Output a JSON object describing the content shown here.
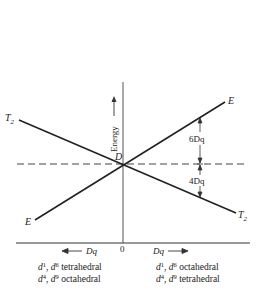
{
  "diagram": {
    "title": "",
    "axes": {
      "y_label": "Energy",
      "x_origin_label": "0",
      "x_left_label": "Dq",
      "x_right_label": "Dq"
    },
    "free_ion_term": "D",
    "levels": {
      "left_upper": {
        "symbol": "T",
        "subscript": "2"
      },
      "left_lower": {
        "symbol": "E",
        "subscript": ""
      },
      "right_upper": {
        "symbol": "E",
        "subscript": ""
      },
      "right_lower": {
        "symbol": "T",
        "subscript": "2"
      }
    },
    "splittings": {
      "upper": "6Dq",
      "lower": "4Dq"
    },
    "captions": {
      "left": [
        {
          "a": "d",
          "a_sup": "1",
          "sep": ", ",
          "b": "d",
          "b_sup": "6",
          "geometry": " tetrahedral"
        },
        {
          "a": "d",
          "a_sup": "4",
          "sep": ", ",
          "b": "d",
          "b_sup": "9",
          "geometry": " octahedral"
        }
      ],
      "right": [
        {
          "a": "d",
          "a_sup": "1",
          "sep": ", ",
          "b": "d",
          "b_sup": "6",
          "geometry": " octahedral"
        },
        {
          "a": "d",
          "a_sup": "4",
          "sep": ", ",
          "b": "d",
          "b_sup": "9",
          "geometry": " tetrahedral"
        }
      ]
    },
    "colors": {
      "ink": "#222222",
      "background": "#ffffff"
    }
  }
}
